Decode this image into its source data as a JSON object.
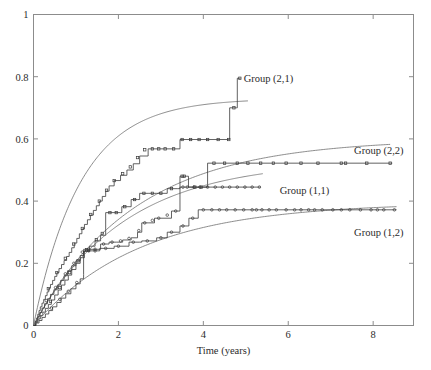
{
  "figure": {
    "background": "#ffffff",
    "axis_color": "#8c8c8c",
    "step_color": "#3a3a3a",
    "fit_color": "#6e6e6e"
  },
  "chart_data": {
    "type": "line",
    "title": "",
    "xlabel": "Time (years)",
    "ylabel": "",
    "xlim": [
      0,
      8.95
    ],
    "ylim": [
      0,
      1
    ],
    "xticks": [
      0,
      2,
      4,
      6,
      8
    ],
    "xtick_labels": [
      "0",
      "2",
      "4",
      "6",
      "8"
    ],
    "yticks": [
      0,
      0.2,
      0.4,
      0.6,
      0.8,
      1
    ],
    "ytick_labels": [
      "0",
      "0.2",
      "0.4",
      "0.6",
      "0.8",
      "1"
    ],
    "grid": false,
    "legend_position": "inline-annotations",
    "annotations": [
      {
        "text": "Group (2,1)",
        "x": 4.95,
        "y": 0.795
      },
      {
        "text": "Group (2,2)",
        "x": 7.55,
        "y": 0.565
      },
      {
        "text": "Group (1,1)",
        "x": 5.8,
        "y": 0.435
      },
      {
        "text": "Group (1,2)",
        "x": 7.55,
        "y": 0.3
      }
    ],
    "series": [
      {
        "name": "Group (2,1)",
        "style": "step-with-markers",
        "plateau": 0.8,
        "step_points": [
          [
            0.0,
            0.0
          ],
          [
            0.04,
            0.012
          ],
          [
            0.07,
            0.024
          ],
          [
            0.1,
            0.036
          ],
          [
            0.13,
            0.048
          ],
          [
            0.16,
            0.06
          ],
          [
            0.2,
            0.072
          ],
          [
            0.24,
            0.084
          ],
          [
            0.28,
            0.096
          ],
          [
            0.32,
            0.108
          ],
          [
            0.36,
            0.12
          ],
          [
            0.4,
            0.132
          ],
          [
            0.45,
            0.145
          ],
          [
            0.5,
            0.158
          ],
          [
            0.55,
            0.17
          ],
          [
            0.6,
            0.183
          ],
          [
            0.66,
            0.196
          ],
          [
            0.72,
            0.209
          ],
          [
            0.78,
            0.222
          ],
          [
            0.84,
            0.235
          ],
          [
            0.9,
            0.25
          ],
          [
            0.96,
            0.265
          ],
          [
            1.02,
            0.28
          ],
          [
            1.08,
            0.295
          ],
          [
            1.14,
            0.31
          ],
          [
            1.2,
            0.325
          ],
          [
            1.27,
            0.34
          ],
          [
            1.34,
            0.355
          ],
          [
            1.41,
            0.37
          ],
          [
            1.48,
            0.385
          ],
          [
            1.55,
            0.4
          ],
          [
            1.62,
            0.415
          ],
          [
            1.7,
            0.432
          ],
          [
            1.78,
            0.449
          ],
          [
            1.9,
            0.466
          ],
          [
            2.05,
            0.483
          ],
          [
            2.2,
            0.5
          ],
          [
            2.35,
            0.52
          ],
          [
            2.5,
            0.545
          ],
          [
            2.7,
            0.568
          ],
          [
            3.05,
            0.568
          ],
          [
            3.45,
            0.598
          ],
          [
            4.6,
            0.598
          ],
          [
            4.62,
            0.7
          ],
          [
            4.78,
            0.7
          ],
          [
            4.8,
            0.795
          ],
          [
            4.88,
            0.795
          ]
        ],
        "markers": [
          [
            0.35,
            0.118
          ],
          [
            0.55,
            0.17
          ],
          [
            0.75,
            0.216
          ],
          [
            0.95,
            0.262
          ],
          [
            1.15,
            0.312
          ],
          [
            1.35,
            0.357
          ],
          [
            1.55,
            0.4
          ],
          [
            1.72,
            0.435
          ],
          [
            1.9,
            0.466
          ],
          [
            2.1,
            0.488
          ],
          [
            2.28,
            0.51
          ],
          [
            2.45,
            0.54
          ],
          [
            2.62,
            0.565
          ],
          [
            2.8,
            0.568
          ],
          [
            2.95,
            0.568
          ],
          [
            3.1,
            0.568
          ],
          [
            3.3,
            0.568
          ],
          [
            3.5,
            0.598
          ],
          [
            3.7,
            0.598
          ],
          [
            3.9,
            0.598
          ],
          [
            4.1,
            0.598
          ],
          [
            4.35,
            0.598
          ],
          [
            4.6,
            0.598
          ],
          [
            4.72,
            0.7
          ],
          [
            4.86,
            0.795
          ]
        ],
        "fit_curve": {
          "model": "a*(1-exp(-b*t))",
          "a": 0.73,
          "b": 0.9,
          "t_max": 5.05
        }
      },
      {
        "name": "Group (2,2)",
        "style": "step-with-markers",
        "plateau": 0.522,
        "step_points": [
          [
            0.0,
            0.0
          ],
          [
            0.05,
            0.01
          ],
          [
            0.1,
            0.021
          ],
          [
            0.16,
            0.032
          ],
          [
            0.22,
            0.043
          ],
          [
            0.28,
            0.055
          ],
          [
            0.35,
            0.068
          ],
          [
            0.42,
            0.082
          ],
          [
            0.5,
            0.098
          ],
          [
            0.58,
            0.114
          ],
          [
            0.66,
            0.13
          ],
          [
            0.74,
            0.146
          ],
          [
            0.82,
            0.162
          ],
          [
            0.9,
            0.18
          ],
          [
            1.0,
            0.2
          ],
          [
            1.1,
            0.218
          ],
          [
            1.2,
            0.238
          ],
          [
            1.32,
            0.255
          ],
          [
            1.45,
            0.272
          ],
          [
            1.58,
            0.29
          ],
          [
            1.7,
            0.31
          ],
          [
            1.7,
            0.363
          ],
          [
            2.05,
            0.363
          ],
          [
            2.08,
            0.382
          ],
          [
            2.25,
            0.382
          ],
          [
            2.3,
            0.405
          ],
          [
            2.45,
            0.405
          ],
          [
            2.5,
            0.425
          ],
          [
            2.7,
            0.425
          ],
          [
            2.9,
            0.425
          ],
          [
            3.15,
            0.44
          ],
          [
            3.4,
            0.44
          ],
          [
            3.45,
            0.48
          ],
          [
            3.6,
            0.48
          ],
          [
            3.65,
            0.445
          ],
          [
            4.05,
            0.445
          ],
          [
            4.1,
            0.522
          ],
          [
            8.45,
            0.522
          ]
        ],
        "markers": [
          [
            0.4,
            0.078
          ],
          [
            0.62,
            0.122
          ],
          [
            0.85,
            0.17
          ],
          [
            1.05,
            0.208
          ],
          [
            1.25,
            0.244
          ],
          [
            1.48,
            0.276
          ],
          [
            1.62,
            0.296
          ],
          [
            1.8,
            0.363
          ],
          [
            1.95,
            0.363
          ],
          [
            2.15,
            0.382
          ],
          [
            2.38,
            0.405
          ],
          [
            2.6,
            0.425
          ],
          [
            2.8,
            0.425
          ],
          [
            3.0,
            0.425
          ],
          [
            3.25,
            0.44
          ],
          [
            3.5,
            0.48
          ],
          [
            3.55,
            0.48
          ],
          [
            3.8,
            0.445
          ],
          [
            3.95,
            0.445
          ],
          [
            4.25,
            0.522
          ],
          [
            4.5,
            0.522
          ],
          [
            4.8,
            0.522
          ],
          [
            5.05,
            0.522
          ],
          [
            5.35,
            0.522
          ],
          [
            5.65,
            0.522
          ],
          [
            5.95,
            0.522
          ],
          [
            6.3,
            0.522
          ],
          [
            6.7,
            0.522
          ],
          [
            7.25,
            0.522
          ],
          [
            7.35,
            0.522
          ],
          [
            7.85,
            0.522
          ],
          [
            8.4,
            0.522
          ]
        ],
        "fit_curve": {
          "model": "a*(1-exp(-b*t))",
          "a": 0.6,
          "b": 0.42,
          "t_max": 8.4
        }
      },
      {
        "name": "Group (1,1)",
        "style": "step-with-markers",
        "plateau": 0.445,
        "step_points": [
          [
            0.0,
            0.0
          ],
          [
            0.05,
            0.014
          ],
          [
            0.1,
            0.028
          ],
          [
            0.15,
            0.042
          ],
          [
            0.2,
            0.056
          ],
          [
            0.26,
            0.07
          ],
          [
            0.33,
            0.086
          ],
          [
            0.4,
            0.1
          ],
          [
            0.48,
            0.115
          ],
          [
            0.56,
            0.13
          ],
          [
            0.64,
            0.145
          ],
          [
            0.72,
            0.16
          ],
          [
            0.8,
            0.176
          ],
          [
            0.9,
            0.192
          ],
          [
            1.0,
            0.208
          ],
          [
            1.1,
            0.225
          ],
          [
            1.18,
            0.242
          ],
          [
            1.18,
            0.245
          ],
          [
            1.55,
            0.245
          ],
          [
            1.58,
            0.262
          ],
          [
            1.75,
            0.262
          ],
          [
            1.78,
            0.268
          ],
          [
            1.95,
            0.268
          ],
          [
            2.1,
            0.275
          ],
          [
            2.3,
            0.282
          ],
          [
            2.45,
            0.3
          ],
          [
            2.55,
            0.33
          ],
          [
            2.7,
            0.33
          ],
          [
            2.85,
            0.345
          ],
          [
            3.0,
            0.345
          ],
          [
            3.25,
            0.368
          ],
          [
            3.4,
            0.368
          ],
          [
            3.45,
            0.445
          ],
          [
            5.35,
            0.445
          ]
        ],
        "markers": [
          [
            0.3,
            0.08
          ],
          [
            0.52,
            0.122
          ],
          [
            0.75,
            0.166
          ],
          [
            0.95,
            0.2
          ],
          [
            1.15,
            0.236
          ],
          [
            1.3,
            0.245
          ],
          [
            1.45,
            0.245
          ],
          [
            1.65,
            0.262
          ],
          [
            1.85,
            0.268
          ],
          [
            2.05,
            0.272
          ],
          [
            2.25,
            0.28
          ],
          [
            2.48,
            0.305
          ],
          [
            2.62,
            0.33
          ],
          [
            2.8,
            0.338
          ],
          [
            2.95,
            0.345
          ],
          [
            3.15,
            0.355
          ],
          [
            3.35,
            0.368
          ],
          [
            3.52,
            0.445
          ],
          [
            3.62,
            0.445
          ],
          [
            3.78,
            0.445
          ],
          [
            3.92,
            0.445
          ],
          [
            4.1,
            0.445
          ],
          [
            4.28,
            0.445
          ],
          [
            4.45,
            0.445
          ],
          [
            4.62,
            0.445
          ],
          [
            4.8,
            0.445
          ],
          [
            4.98,
            0.445
          ],
          [
            5.15,
            0.445
          ],
          [
            5.32,
            0.445
          ]
        ],
        "fit_curve": {
          "model": "a*(1-exp(-b*t))",
          "a": 0.53,
          "b": 0.47,
          "t_max": 5.4
        }
      },
      {
        "name": "Group (1,2)",
        "style": "step-with-markers",
        "plateau": 0.372,
        "step_points": [
          [
            0.0,
            0.0
          ],
          [
            0.06,
            0.008
          ],
          [
            0.13,
            0.016
          ],
          [
            0.2,
            0.026
          ],
          [
            0.28,
            0.037
          ],
          [
            0.36,
            0.048
          ],
          [
            0.45,
            0.06
          ],
          [
            0.55,
            0.074
          ],
          [
            0.65,
            0.088
          ],
          [
            0.76,
            0.102
          ],
          [
            0.88,
            0.118
          ],
          [
            1.0,
            0.134
          ],
          [
            1.1,
            0.15
          ],
          [
            1.18,
            0.164
          ],
          [
            1.18,
            0.24
          ],
          [
            1.52,
            0.24
          ],
          [
            1.56,
            0.248
          ],
          [
            1.85,
            0.248
          ],
          [
            1.9,
            0.255
          ],
          [
            2.2,
            0.255
          ],
          [
            2.25,
            0.268
          ],
          [
            2.5,
            0.268
          ],
          [
            2.55,
            0.272
          ],
          [
            2.85,
            0.272
          ],
          [
            2.9,
            0.282
          ],
          [
            3.1,
            0.282
          ],
          [
            3.15,
            0.3
          ],
          [
            3.4,
            0.3
          ],
          [
            3.45,
            0.32
          ],
          [
            3.62,
            0.32
          ],
          [
            3.66,
            0.345
          ],
          [
            3.85,
            0.345
          ],
          [
            3.88,
            0.372
          ],
          [
            8.55,
            0.372
          ]
        ],
        "markers": [
          [
            0.42,
            0.056
          ],
          [
            0.62,
            0.084
          ],
          [
            0.82,
            0.11
          ],
          [
            1.02,
            0.138
          ],
          [
            1.3,
            0.24
          ],
          [
            1.45,
            0.24
          ],
          [
            1.7,
            0.248
          ],
          [
            2.0,
            0.255
          ],
          [
            2.35,
            0.268
          ],
          [
            2.68,
            0.272
          ],
          [
            3.0,
            0.282
          ],
          [
            3.25,
            0.3
          ],
          [
            3.52,
            0.32
          ],
          [
            3.75,
            0.345
          ],
          [
            4.0,
            0.372
          ],
          [
            4.2,
            0.372
          ],
          [
            4.38,
            0.372
          ],
          [
            4.55,
            0.372
          ],
          [
            4.75,
            0.372
          ],
          [
            4.95,
            0.372
          ],
          [
            5.15,
            0.372
          ],
          [
            5.25,
            0.372
          ],
          [
            5.38,
            0.372
          ],
          [
            5.55,
            0.372
          ],
          [
            5.72,
            0.372
          ],
          [
            5.95,
            0.372
          ],
          [
            6.15,
            0.372
          ],
          [
            6.3,
            0.372
          ],
          [
            6.48,
            0.372
          ],
          [
            6.62,
            0.372
          ],
          [
            6.8,
            0.372
          ],
          [
            7.05,
            0.372
          ],
          [
            7.25,
            0.372
          ],
          [
            7.45,
            0.372
          ],
          [
            7.7,
            0.372
          ],
          [
            7.95,
            0.372
          ],
          [
            8.1,
            0.372
          ],
          [
            8.25,
            0.372
          ],
          [
            8.5,
            0.372
          ]
        ],
        "fit_curve": {
          "model": "a*(1-exp(-b*t))",
          "a": 0.395,
          "b": 0.4,
          "t_max": 8.55
        }
      }
    ]
  }
}
